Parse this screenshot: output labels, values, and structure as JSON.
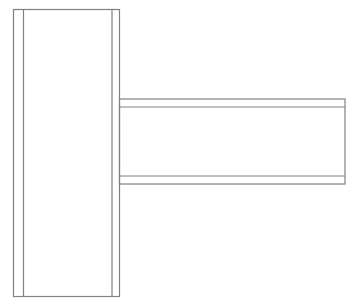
{
  "diagram": {
    "type": "beam-to-column connection elevation",
    "stroke_color": "#808080",
    "background": "#ffffff",
    "column": {
      "outer": {
        "x1": 13,
        "y1": 9,
        "x2": 120,
        "y2": 297
      },
      "inner_flange_lines_x": [
        23.5,
        112
      ]
    },
    "beam": {
      "outer": {
        "x1": 120,
        "y1": 99,
        "x2": 345,
        "y2": 184
      },
      "inner_flange_lines_y": [
        107,
        176
      ]
    }
  }
}
